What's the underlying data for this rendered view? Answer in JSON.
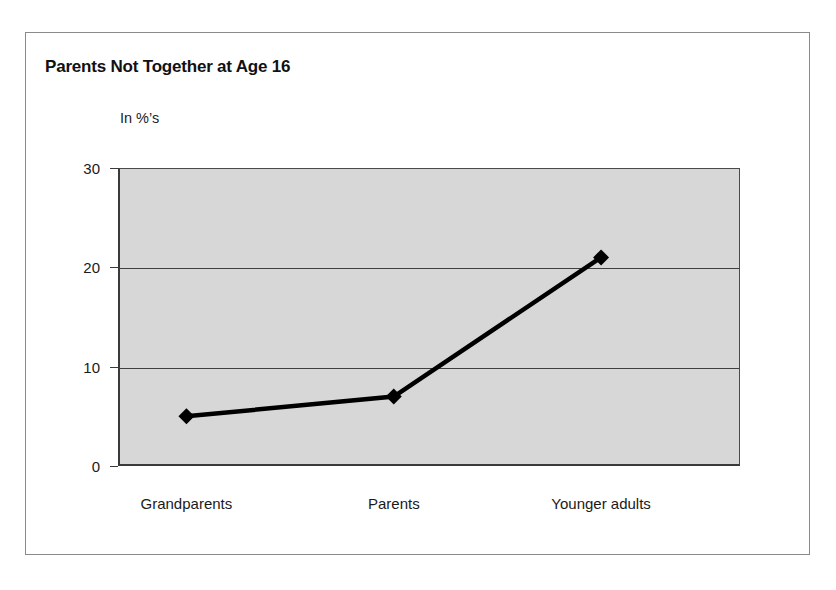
{
  "figure": {
    "title": "Parents Not Together at Age 16",
    "y_axis_caption": "In %’s"
  },
  "axis": {
    "y_ticks": [
      "0",
      "10",
      "20",
      "30"
    ],
    "x_ticks": [
      "Grandparents",
      "Parents",
      "Younger adults"
    ]
  },
  "colors": {
    "plot_background": "#d7d7d7",
    "gridline": "#3f3f3f",
    "series_line": "#000000",
    "marker": "#000000",
    "frame_border": "#8a8a8a",
    "text": "#1a1a1a"
  },
  "chart_data": {
    "type": "line",
    "title": "Parents Not Together at Age 16",
    "subtitle": "",
    "xlabel": "",
    "ylabel": "In ’%’s",
    "categories": [
      "Grandparents",
      "Parents",
      "Younger adults"
    ],
    "values": [
      5,
      7,
      21
    ],
    "series": [
      {
        "name": "Parents not together at age 16",
        "values": [
          5,
          7,
          21
        ]
      }
    ],
    "ylim": [
      0,
      30
    ],
    "yticks": [
      0,
      10,
      20,
      30
    ],
    "grid": true,
    "grid_axis": "y",
    "legend": false,
    "legend_position": "none",
    "marker": "diamond",
    "annotations": []
  }
}
